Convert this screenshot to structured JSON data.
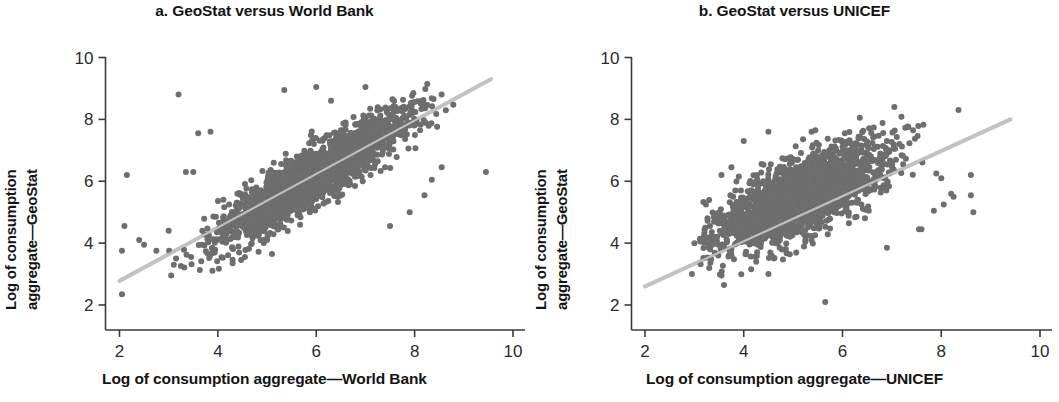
{
  "figure": {
    "background": "#ffffff",
    "point_color": "#6e6e6e",
    "line_color": "#c2c2c2",
    "axis_color": "#3a3a3a"
  },
  "panels": [
    {
      "id": "a",
      "title": "a. GeoStat versus World Bank",
      "ylabel_line1": "Log of consumption",
      "ylabel_line2": "aggregate—GeoStat",
      "xlabel": "Log of consumption aggregate—World Bank"
    },
    {
      "id": "b",
      "title": "b. GeoStat versus UNICEF",
      "ylabel_line1": "Log of consumption",
      "ylabel_line2": "aggregate—GeoStat",
      "xlabel": "Log of consumption aggregate—UNICEF"
    }
  ],
  "ticks": {
    "x": [
      "2",
      "4",
      "6",
      "8",
      "10"
    ],
    "y": [
      "2",
      "4",
      "6",
      "8",
      "10"
    ]
  },
  "chart_data": [
    {
      "type": "scatter",
      "panel": "a",
      "title": "a. GeoStat versus World Bank",
      "xlabel": "Log of consumption aggregate—World Bank",
      "ylabel": "Log of consumption aggregate—GeoStat",
      "xlim": [
        2,
        10
      ],
      "ylim": [
        2,
        10
      ],
      "xticks": [
        2,
        4,
        6,
        8,
        10
      ],
      "yticks": [
        2,
        4,
        6,
        8,
        10
      ],
      "grid": false,
      "legend": "none",
      "marker_color": "#6e6e6e",
      "marker_size": 3,
      "n_points_approx": 2200,
      "cloud": {
        "x_mean": 5.95,
        "y_mean": 6.15,
        "x_sd": 0.95,
        "y_sd": 1.05,
        "correlation": 0.9,
        "x_range": [
          3.0,
          9.5
        ],
        "y_range": [
          2.3,
          9.4
        ]
      },
      "outliers": [
        [
          2.05,
          2.35
        ],
        [
          2.05,
          3.75
        ],
        [
          2.1,
          4.55
        ],
        [
          2.4,
          4.1
        ],
        [
          2.5,
          3.95
        ],
        [
          2.15,
          6.2
        ],
        [
          2.75,
          3.75
        ],
        [
          3.05,
          2.95
        ],
        [
          3.0,
          4.4
        ],
        [
          3.15,
          3.5
        ],
        [
          3.2,
          8.8
        ],
        [
          3.35,
          6.3
        ],
        [
          3.5,
          6.3
        ],
        [
          3.6,
          7.55
        ],
        [
          3.85,
          7.6
        ],
        [
          4.3,
          3.35
        ],
        [
          4.55,
          3.55
        ],
        [
          5.0,
          4.1
        ],
        [
          5.1,
          3.65
        ],
        [
          5.35,
          8.95
        ],
        [
          6.0,
          9.05
        ],
        [
          6.3,
          8.6
        ],
        [
          7.0,
          9.05
        ],
        [
          7.55,
          8.65
        ],
        [
          8.55,
          6.45
        ],
        [
          9.45,
          6.3
        ],
        [
          7.5,
          4.55
        ],
        [
          7.9,
          5.0
        ],
        [
          8.2,
          5.55
        ],
        [
          8.35,
          6.05
        ]
      ],
      "trendline": {
        "type": "linear_fit",
        "x_start": 2.0,
        "y_start": 2.78,
        "x_end": 9.55,
        "y_end": 9.3,
        "slope": 0.863,
        "intercept": 1.054,
        "color": "#c2c2c2",
        "width": 4
      }
    },
    {
      "type": "scatter",
      "panel": "b",
      "title": "b. GeoStat versus UNICEF",
      "xlabel": "Log of consumption aggregate—UNICEF",
      "ylabel": "Log of consumption aggregate—GeoStat",
      "xlim": [
        2,
        10
      ],
      "ylim": [
        2,
        10
      ],
      "xticks": [
        2,
        4,
        6,
        8,
        10
      ],
      "yticks": [
        2,
        4,
        6,
        8,
        10
      ],
      "grid": false,
      "legend": "none",
      "marker_color": "#6e6e6e",
      "marker_size": 3,
      "n_points_approx": 2200,
      "cloud": {
        "x_mean": 5.15,
        "y_mean": 5.5,
        "x_sd": 0.85,
        "y_sd": 0.85,
        "correlation": 0.72,
        "x_range": [
          3.1,
          8.8
        ],
        "y_range": [
          2.1,
          8.4
        ]
      },
      "outliers": [
        [
          2.95,
          3.0
        ],
        [
          3.0,
          4.0
        ],
        [
          3.3,
          3.2
        ],
        [
          3.55,
          2.95
        ],
        [
          3.6,
          2.65
        ],
        [
          5.65,
          2.1
        ],
        [
          4.5,
          3.0
        ],
        [
          6.9,
          3.85
        ],
        [
          7.55,
          4.45
        ],
        [
          7.6,
          4.45
        ],
        [
          7.85,
          5.05
        ],
        [
          8.05,
          5.25
        ],
        [
          8.2,
          5.6
        ],
        [
          8.25,
          5.5
        ],
        [
          8.6,
          5.55
        ],
        [
          8.65,
          5.0
        ],
        [
          8.35,
          8.3
        ],
        [
          7.05,
          8.4
        ],
        [
          6.35,
          8.05
        ],
        [
          5.45,
          7.65
        ],
        [
          4.5,
          7.6
        ],
        [
          4.0,
          7.3
        ],
        [
          3.75,
          6.45
        ],
        [
          3.55,
          6.2
        ],
        [
          3.9,
          6.15
        ],
        [
          8.0,
          6.1
        ],
        [
          7.9,
          6.25
        ],
        [
          8.6,
          6.2
        ]
      ],
      "trendline": {
        "type": "linear_fit",
        "x_start": 2.0,
        "y_start": 2.6,
        "x_end": 9.4,
        "y_end": 8.0,
        "slope": 0.73,
        "intercept": 1.14,
        "color": "#c2c2c2",
        "width": 4
      }
    }
  ]
}
